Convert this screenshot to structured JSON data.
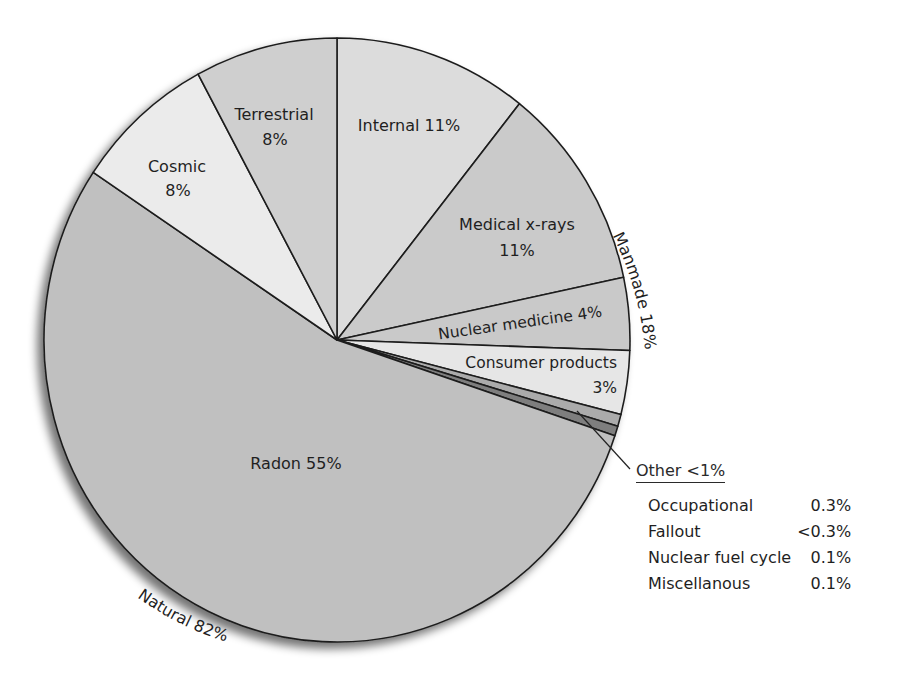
{
  "chart_data": {
    "type": "pie",
    "title": "",
    "center": [
      337,
      340
    ],
    "radius": [
      293,
      302
    ],
    "start_angle_deg": -90,
    "slices": [
      {
        "key": "internal",
        "label": "Internal",
        "value": 11,
        "display": "Internal 11%",
        "color": "#dcdcdc",
        "group": "Natural",
        "a0": -90,
        "a1": -51.5
      },
      {
        "key": "medical",
        "label": "Medical x-rays",
        "value": 11,
        "display": "11%",
        "color": "#cacaca",
        "group": "Manmade",
        "a0": -51.5,
        "a1": -12
      },
      {
        "key": "nuclear_medicine",
        "label": "Nuclear medicine",
        "value": 4,
        "display": "Nuclear medicine 4%",
        "color": "#c9c9c9",
        "group": "Manmade",
        "a0": -12,
        "a1": 2
      },
      {
        "key": "consumer",
        "label": "Consumer products",
        "value": 3,
        "display": "3%",
        "color": "#e6e6e6",
        "group": "Manmade",
        "a0": 2,
        "a1": 14.3
      },
      {
        "key": "other_a",
        "label": "Other",
        "value": 0.5,
        "display": "",
        "color": "#ababab",
        "group": "Manmade",
        "a0": 14.3,
        "a1": 16.6
      },
      {
        "key": "other_b",
        "label": "Other",
        "value": 0.5,
        "display": "",
        "color": "#7e7e7e",
        "group": "Manmade",
        "a0": 16.6,
        "a1": 18.5
      },
      {
        "key": "radon",
        "label": "Radon",
        "value": 55,
        "display": "Radon 55%",
        "color": "#c0c0c0",
        "group": "Natural",
        "a0": 18.5,
        "a1": 213.7
      },
      {
        "key": "cosmic",
        "label": "Cosmic",
        "value": 8,
        "display": "8%",
        "color": "#ebebeb",
        "group": "Natural",
        "a0": 213.7,
        "a1": 241.7
      },
      {
        "key": "terrestrial",
        "label": "Terrestrial",
        "value": 8,
        "display": "8%",
        "color": "#cfcfcf",
        "group": "Natural",
        "a0": 241.7,
        "a1": 270
      }
    ],
    "groups": [
      {
        "label": "Natural 82%",
        "value": 82
      },
      {
        "label": "Manmade 18%",
        "value": 18
      }
    ],
    "other_breakdown": {
      "title": "Other <1%",
      "items": [
        {
          "label": "Occupational",
          "value": "0.3%"
        },
        {
          "label": "Fallout",
          "value": "<0.3%"
        },
        {
          "label": "Nuclear fuel cycle",
          "value": "0.1%"
        },
        {
          "label": "Miscellanous",
          "value": "0.1%"
        }
      ]
    },
    "legend": "none",
    "grid": false
  },
  "labels": {
    "terrestrial_name": "Terrestrial",
    "terrestrial_pct": "8%",
    "cosmic_name": "Cosmic",
    "cosmic_pct": "8%",
    "internal": "Internal 11%",
    "medical_name": "Medical x-rays",
    "medical_pct": "11%",
    "nuclear_medicine": "Nuclear medicine 4%",
    "consumer_name": "Consumer products",
    "consumer_pct": "3%",
    "radon": "Radon 55%",
    "manmade": "Manmade 18%",
    "natural": "Natural 82%"
  },
  "other": {
    "title": "Other <1%",
    "rows": [
      {
        "label": "Occupational",
        "value": "0.3%"
      },
      {
        "label": "Fallout",
        "value": "<0.3%"
      },
      {
        "label": "Nuclear fuel cycle",
        "value": "0.1%"
      },
      {
        "label": "Miscellanous",
        "value": "0.1%"
      }
    ]
  }
}
